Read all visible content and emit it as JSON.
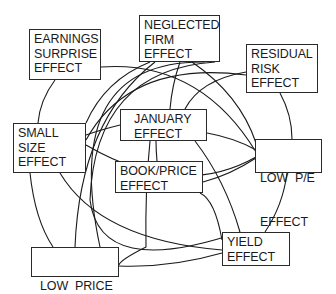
{
  "diagram": {
    "type": "network",
    "nodes": [
      {
        "id": "earnings",
        "lines": [
          "EARNINGS",
          "SURPRISE",
          "EFFECT"
        ]
      },
      {
        "id": "neglected",
        "lines": [
          "NEGLECTED",
          "FIRM",
          "EFFECT"
        ]
      },
      {
        "id": "residual",
        "lines": [
          "RESIDUAL",
          "RISK",
          "EFFECT"
        ]
      },
      {
        "id": "january",
        "lines": [
          "JANUARY",
          "EFFECT"
        ]
      },
      {
        "id": "small",
        "lines": [
          "SMALL",
          "SIZE",
          "EFFECT"
        ]
      },
      {
        "id": "lowpe",
        "lines": [
          "LOW  P/E",
          "EFFECT"
        ]
      },
      {
        "id": "bookprice",
        "lines": [
          "BOOK/PRICE",
          "EFFECT"
        ]
      },
      {
        "id": "yield",
        "lines": [
          "YIELD",
          "EFFECT"
        ]
      },
      {
        "id": "lowprice",
        "lines": [
          "LOW  PRICE",
          "EFFECT"
        ]
      }
    ],
    "colors": {
      "line": "#1a1a1a",
      "border": "#2a2a2a",
      "background": "#ffffff"
    }
  }
}
